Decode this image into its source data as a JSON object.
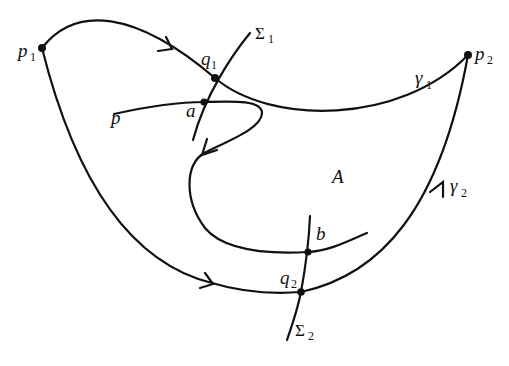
{
  "diagram": {
    "type": "phase-portrait-region",
    "colors": {
      "stroke": "#111111",
      "background": "#ffffff"
    },
    "labels": {
      "p1": {
        "base": "p",
        "sub": "1"
      },
      "p2": {
        "base": "p",
        "sub": "2"
      },
      "q1": {
        "base": "q",
        "sub": "1"
      },
      "q2": {
        "base": "q",
        "sub": "2"
      },
      "sigma1": {
        "base": "Σ",
        "sub": "1"
      },
      "sigma2": {
        "base": "Σ",
        "sub": "2"
      },
      "gamma1": {
        "base": "γ",
        "sub": "1"
      },
      "gamma2": {
        "base": "γ",
        "sub": "2"
      },
      "a": "a",
      "b": "b",
      "p": "p",
      "region": "A"
    },
    "points": [
      "p1",
      "p2",
      "q1",
      "q2",
      "a",
      "b"
    ],
    "curves": [
      "gamma1",
      "gamma2",
      "sigma1",
      "sigma2",
      "trajectory-from-p"
    ]
  }
}
